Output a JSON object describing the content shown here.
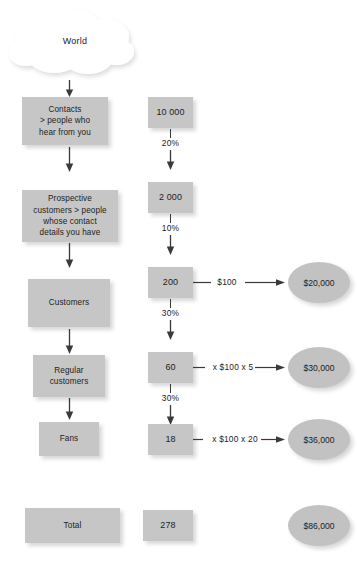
{
  "diagram": {
    "colors": {
      "box_fill": "#c6c6c6",
      "ellipse_fill": "#c2c2c2",
      "cloud_fill": "#ffffff",
      "text": "#1d1d1d",
      "arrow": "#3a3a3a"
    },
    "source": {
      "label": "World"
    },
    "stages": [
      {
        "label": "Contacts\n> people who\nhear from you"
      },
      {
        "label": "Prospective\ncustomers > people\nwhose contact\ndetails you have"
      },
      {
        "label": "Customers"
      },
      {
        "label": "Regular\ncustomers"
      },
      {
        "label": "Fans"
      }
    ],
    "counts": [
      {
        "value": "10 000"
      },
      {
        "value": "2 000"
      },
      {
        "value": "200"
      },
      {
        "value": "60"
      },
      {
        "value": "18"
      }
    ],
    "conversions": [
      {
        "rate": "20%"
      },
      {
        "rate": "10%"
      },
      {
        "rate": "30%"
      },
      {
        "rate": "30%"
      }
    ],
    "revenue_rows": [
      {
        "multiplier": "$100",
        "amount": "$20,000"
      },
      {
        "multiplier": "x $100 x 5",
        "amount": "$30,000"
      },
      {
        "multiplier": "x $100 x 20",
        "amount": "$36,000"
      }
    ],
    "total": {
      "label": "Total",
      "count": "278",
      "amount": "$86,000"
    }
  }
}
